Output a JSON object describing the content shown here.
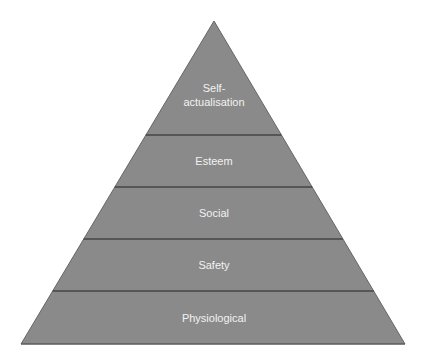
{
  "diagram": {
    "shape": "pyramid",
    "colors": {
      "fill": "#8a8a8a",
      "divider": "#444444",
      "outline": "#555555",
      "text": "#f2f2f2"
    },
    "levels": [
      {
        "label_lines": [
          "Self-",
          "actualisation"
        ]
      },
      {
        "label": "Esteem"
      },
      {
        "label": "Social"
      },
      {
        "label": "Safety"
      },
      {
        "label": "Physiological"
      }
    ]
  }
}
